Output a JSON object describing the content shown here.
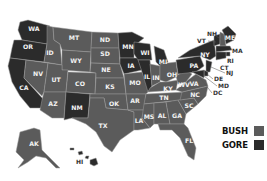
{
  "colors": {
    "bush": "#5b5b5b",
    "gore": "#2b2b2b",
    "background": "#ffffff"
  },
  "legend": {
    "items": [
      {
        "label": "BUSH",
        "color": "#5b5b5b"
      },
      {
        "label": "GORE",
        "color": "#2b2b2b"
      }
    ]
  },
  "states": {
    "WA": {
      "label": "WA",
      "winner": "gore"
    },
    "OR": {
      "label": "OR",
      "winner": "gore"
    },
    "CA": {
      "label": "CA",
      "winner": "gore"
    },
    "NV": {
      "label": "NV",
      "winner": "bush"
    },
    "ID": {
      "label": "ID",
      "winner": "bush"
    },
    "MT": {
      "label": "MT",
      "winner": "bush"
    },
    "WY": {
      "label": "WY",
      "winner": "bush"
    },
    "UT": {
      "label": "UT",
      "winner": "bush"
    },
    "AZ": {
      "label": "AZ",
      "winner": "bush"
    },
    "CO": {
      "label": "CO",
      "winner": "bush"
    },
    "NM": {
      "label": "NM",
      "winner": "gore"
    },
    "ND": {
      "label": "ND",
      "winner": "bush"
    },
    "SD": {
      "label": "SD",
      "winner": "bush"
    },
    "NE": {
      "label": "NE",
      "winner": "bush"
    },
    "KS": {
      "label": "KS",
      "winner": "bush"
    },
    "OK": {
      "label": "OK",
      "winner": "bush"
    },
    "TX": {
      "label": "TX",
      "winner": "bush"
    },
    "MN": {
      "label": "MN",
      "winner": "gore"
    },
    "IA": {
      "label": "IA",
      "winner": "gore"
    },
    "MO": {
      "label": "MO",
      "winner": "bush"
    },
    "AR": {
      "label": "AR",
      "winner": "bush"
    },
    "LA": {
      "label": "LA",
      "winner": "bush"
    },
    "WI": {
      "label": "WI",
      "winner": "gore"
    },
    "IL": {
      "label": "IL",
      "winner": "gore"
    },
    "MI": {
      "label": "MI",
      "winner": "gore"
    },
    "IN": {
      "label": "IN",
      "winner": "bush"
    },
    "OH": {
      "label": "OH",
      "winner": "bush"
    },
    "KY": {
      "label": "KY",
      "winner": "bush"
    },
    "TN": {
      "label": "TN",
      "winner": "bush"
    },
    "MS": {
      "label": "MS",
      "winner": "bush"
    },
    "AL": {
      "label": "AL",
      "winner": "bush"
    },
    "GA": {
      "label": "GA",
      "winner": "bush"
    },
    "FL": {
      "label": "FL",
      "winner": "bush"
    },
    "SC": {
      "label": "SC",
      "winner": "bush"
    },
    "NC": {
      "label": "NC",
      "winner": "bush"
    },
    "VA": {
      "label": "VA",
      "winner": "bush"
    },
    "WV": {
      "label": "WV",
      "winner": "bush"
    },
    "PA": {
      "label": "PA",
      "winner": "gore"
    },
    "NY": {
      "label": "NY",
      "winner": "gore"
    },
    "VT": {
      "label": "VT",
      "winner": "gore"
    },
    "NH": {
      "label": "NH",
      "winner": "bush"
    },
    "ME": {
      "label": "ME",
      "winner": "gore"
    },
    "MA": {
      "label": "MA",
      "winner": "gore"
    },
    "RI": {
      "label": "RI",
      "winner": "gore"
    },
    "CT": {
      "label": "CT",
      "winner": "gore"
    },
    "NJ": {
      "label": "NJ",
      "winner": "gore"
    },
    "DE": {
      "label": "DE",
      "winner": "gore"
    },
    "MD": {
      "label": "MD",
      "winner": "gore"
    },
    "DC": {
      "label": "DC",
      "winner": "gore"
    },
    "AK": {
      "label": "AK",
      "winner": "bush"
    },
    "HI": {
      "label": "HI",
      "winner": "gore"
    }
  }
}
